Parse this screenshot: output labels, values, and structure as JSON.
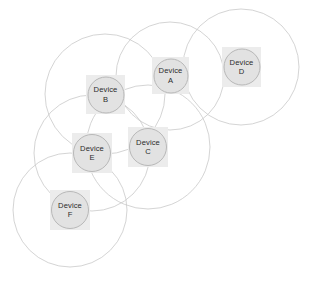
{
  "diagram": {
    "width": 313,
    "height": 282,
    "background_color": "#ffffff",
    "node_box_color": "#ececec",
    "node_circle_color": "#e2e2e2",
    "node_circle_border_color": "#b8b8b8",
    "coverage_circle_color": "#c9c9c9",
    "label_color": "#2b2b2b",
    "nodes": [
      {
        "id": "A",
        "label": "Device\nA",
        "name_line": "Device",
        "id_line": "A",
        "box": {
          "x": 152,
          "y": 57,
          "w": 37,
          "h": 37
        },
        "circle_d": 35,
        "coverage": {
          "cx": 170,
          "cy": 76,
          "r": 54
        }
      },
      {
        "id": "B",
        "label": "Device\nB",
        "name_line": "Device",
        "id_line": "B",
        "box": {
          "x": 86,
          "y": 75,
          "w": 39,
          "h": 39
        },
        "circle_d": 37,
        "coverage": {
          "cx": 105,
          "cy": 94,
          "r": 60
        }
      },
      {
        "id": "C",
        "label": "Device\nC",
        "name_line": "Device",
        "id_line": "C",
        "box": {
          "x": 128,
          "y": 127,
          "w": 40,
          "h": 40
        },
        "circle_d": 38,
        "coverage": {
          "cx": 148,
          "cy": 147,
          "r": 62
        }
      },
      {
        "id": "D",
        "label": "Device\nD",
        "name_line": "Device",
        "id_line": "D",
        "box": {
          "x": 222,
          "y": 47,
          "w": 39,
          "h": 40
        },
        "circle_d": 37,
        "coverage": {
          "cx": 241,
          "cy": 67,
          "r": 58
        }
      },
      {
        "id": "E",
        "label": "Device\nE",
        "name_line": "Device",
        "id_line": "E",
        "box": {
          "x": 72,
          "y": 133,
          "w": 40,
          "h": 40
        },
        "circle_d": 38,
        "coverage": {
          "cx": 92,
          "cy": 153,
          "r": 58
        }
      },
      {
        "id": "F",
        "label": "Device\nF",
        "name_line": "Device",
        "id_line": "F",
        "box": {
          "x": 50,
          "y": 190,
          "w": 40,
          "h": 40
        },
        "circle_d": 38,
        "coverage": {
          "cx": 70,
          "cy": 210,
          "r": 57
        }
      }
    ]
  }
}
